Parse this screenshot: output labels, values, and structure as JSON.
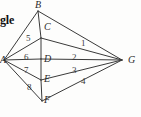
{
  "figure": {
    "caption_fragment": "gle",
    "vertices": [
      {
        "id": "A",
        "label": "A",
        "x": 4,
        "y": 60,
        "label_x": 0,
        "label_y": 55
      },
      {
        "id": "B",
        "label": "B",
        "x": 38,
        "y": 11,
        "label_x": 35,
        "label_y": 0
      },
      {
        "id": "C",
        "label": "C",
        "x": 41,
        "y": 38,
        "label_x": 44,
        "label_y": 22
      },
      {
        "id": "D",
        "label": "D",
        "x": 41,
        "y": 59,
        "label_x": 44,
        "label_y": 54
      },
      {
        "id": "E",
        "label": "E",
        "x": 41,
        "y": 80,
        "label_x": 44,
        "label_y": 74
      },
      {
        "id": "F",
        "label": "F",
        "x": 42,
        "y": 101,
        "label_x": 44,
        "label_y": 95
      },
      {
        "id": "G",
        "label": "G",
        "x": 122,
        "y": 60,
        "label_x": 128,
        "label_y": 55
      }
    ],
    "edges": [
      {
        "from": "A",
        "to": "B"
      },
      {
        "from": "A",
        "to": "C"
      },
      {
        "from": "A",
        "to": "D"
      },
      {
        "from": "A",
        "to": "E"
      },
      {
        "from": "A",
        "to": "F"
      },
      {
        "from": "B",
        "to": "C"
      },
      {
        "from": "C",
        "to": "D"
      },
      {
        "from": "D",
        "to": "E"
      },
      {
        "from": "E",
        "to": "F"
      },
      {
        "from": "B",
        "to": "G"
      },
      {
        "from": "C",
        "to": "G"
      },
      {
        "from": "D",
        "to": "G"
      },
      {
        "from": "E",
        "to": "G"
      },
      {
        "from": "F",
        "to": "G"
      }
    ],
    "angle_labels": [
      {
        "id": "1",
        "text": "1",
        "x": 81,
        "y": 39
      },
      {
        "id": "2",
        "text": "2",
        "x": 72,
        "y": 53
      },
      {
        "id": "3",
        "text": "3",
        "x": 72,
        "y": 66
      },
      {
        "id": "4",
        "text": "4",
        "x": 81,
        "y": 77
      },
      {
        "id": "5",
        "text": "5",
        "x": 26,
        "y": 34
      },
      {
        "id": "6",
        "text": "6",
        "x": 24,
        "y": 53
      },
      {
        "id": "7",
        "text": "7",
        "x": 24,
        "y": 66
      },
      {
        "id": "8",
        "text": "8",
        "x": 27,
        "y": 83
      }
    ],
    "colors": {
      "stroke": "#3a3a3a",
      "background": "#fdfdfc",
      "label": "#2b2b2b"
    }
  }
}
